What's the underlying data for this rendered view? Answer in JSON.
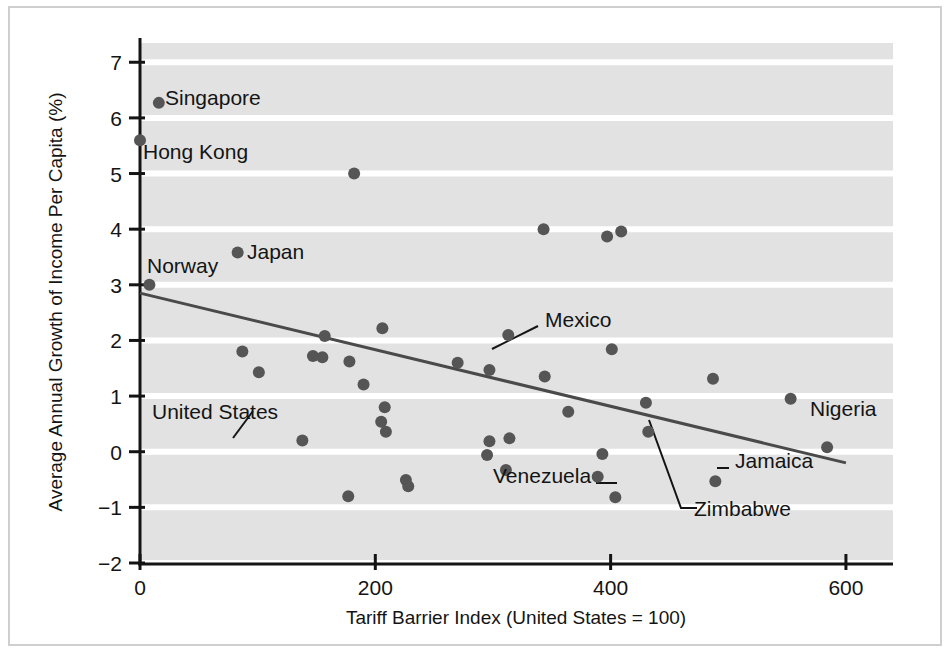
{
  "chart_data": {
    "type": "scatter",
    "title": "",
    "xlabel": "Tariff Barrier Index (United States = 100)",
    "ylabel": "Average Annual Growth of Income Per Capita (%)",
    "xlim": [
      0,
      640
    ],
    "ylim": [
      -2,
      7.4
    ],
    "xticks": [
      0,
      200,
      400,
      600
    ],
    "xtick_labels": [
      "0",
      "200",
      "400",
      "600"
    ],
    "yticks": [
      -2,
      -1,
      0,
      1,
      2,
      3,
      4,
      5,
      6,
      7
    ],
    "ytick_labels": [
      "−2",
      "−1",
      "0",
      "1",
      "2",
      "3",
      "4",
      "5",
      "6",
      "7"
    ],
    "grid": "horizontal-white-lines-on-gray",
    "legend": "none",
    "point_color": "#555555",
    "plot_background": "#e2e2e2",
    "gridline_color": "#ffffff",
    "trendline_color": "#4a4a4a",
    "trendline": {
      "x_start": 0,
      "y_start": 2.85,
      "x_end": 600,
      "y_end": -0.2
    },
    "points": [
      {
        "x": 16,
        "y": 6.27,
        "label": "Singapore",
        "label_side": "right",
        "leader": false
      },
      {
        "x": 0,
        "y": 5.6,
        "label": "Hong Kong",
        "label_side": "below-right",
        "leader": false
      },
      {
        "x": 182,
        "y": 5.0,
        "label": "",
        "leader": false
      },
      {
        "x": 343,
        "y": 4.0,
        "label": "",
        "leader": false
      },
      {
        "x": 397,
        "y": 3.87,
        "label": "",
        "leader": false
      },
      {
        "x": 409,
        "y": 3.96,
        "label": "",
        "leader": false
      },
      {
        "x": 83,
        "y": 3.58,
        "label": "Japan",
        "label_side": "right",
        "leader": false
      },
      {
        "x": 8,
        "y": 3.0,
        "label": "Norway",
        "label_side": "above-left",
        "leader": false
      },
      {
        "x": 206,
        "y": 2.22,
        "label": "",
        "leader": false
      },
      {
        "x": 157,
        "y": 2.08,
        "label": "",
        "leader": false
      },
      {
        "x": 313,
        "y": 2.1,
        "label": "",
        "leader": false
      },
      {
        "x": 87,
        "y": 1.8,
        "label": "",
        "leader": false
      },
      {
        "x": 147,
        "y": 1.72,
        "label": "",
        "leader": false
      },
      {
        "x": 155,
        "y": 1.7,
        "label": "",
        "leader": false
      },
      {
        "x": 178,
        "y": 1.62,
        "label": "",
        "leader": false
      },
      {
        "x": 270,
        "y": 1.6,
        "label": "",
        "leader": false
      },
      {
        "x": 297,
        "y": 1.47,
        "label": "Mexico",
        "label_side": "leader-right",
        "leader": true
      },
      {
        "x": 401,
        "y": 1.84,
        "label": "",
        "leader": false
      },
      {
        "x": 101,
        "y": 1.43,
        "label": "United States",
        "label_side": "leader-below-left",
        "leader": true
      },
      {
        "x": 344,
        "y": 1.35,
        "label": "",
        "leader": false
      },
      {
        "x": 487,
        "y": 1.31,
        "label": "",
        "leader": false
      },
      {
        "x": 190,
        "y": 1.21,
        "label": "",
        "leader": false
      },
      {
        "x": 553,
        "y": 0.95,
        "label": "",
        "leader": false
      },
      {
        "x": 430,
        "y": 0.88,
        "label": "",
        "leader": false
      },
      {
        "x": 208,
        "y": 0.8,
        "label": "",
        "leader": false
      },
      {
        "x": 364,
        "y": 0.72,
        "label": "",
        "leader": false
      },
      {
        "x": 205,
        "y": 0.54,
        "label": "",
        "leader": false
      },
      {
        "x": 209,
        "y": 0.36,
        "label": "",
        "leader": false
      },
      {
        "x": 432,
        "y": 0.36,
        "label": "Zimbabwe",
        "label_side": "leader-below",
        "leader": true
      },
      {
        "x": 314,
        "y": 0.24,
        "label": "",
        "leader": false
      },
      {
        "x": 297,
        "y": 0.19,
        "label": "",
        "leader": false
      },
      {
        "x": 138,
        "y": 0.2,
        "label": "",
        "leader": false
      },
      {
        "x": 584,
        "y": 0.08,
        "label": "Nigeria",
        "label_side": "above-right",
        "leader": false
      },
      {
        "x": 295,
        "y": -0.06,
        "label": "",
        "leader": false
      },
      {
        "x": 393,
        "y": -0.04,
        "label": "",
        "leader": false
      },
      {
        "x": 311,
        "y": -0.33,
        "label": "",
        "leader": false
      },
      {
        "x": 226,
        "y": -0.51,
        "label": "",
        "leader": false
      },
      {
        "x": 389,
        "y": -0.45,
        "label": "",
        "leader": false
      },
      {
        "x": 228,
        "y": -0.62,
        "label": "",
        "leader": false
      },
      {
        "x": 489,
        "y": -0.53,
        "label": "Jamaica",
        "label_side": "leader-right",
        "leader": true
      },
      {
        "x": 177,
        "y": -0.8,
        "label": "",
        "leader": false
      },
      {
        "x": 404,
        "y": -0.82,
        "label": "Venezuela",
        "label_side": "leader-left",
        "leader": true
      }
    ],
    "annotations": [
      {
        "text": "Singapore",
        "x_px": 165,
        "y_px": 105
      },
      {
        "text": "Hong Kong",
        "x_px": 143,
        "y_px": 159
      },
      {
        "text": "Japan",
        "x_px": 247,
        "y_px": 259
      },
      {
        "text": "Norway",
        "x_px": 147,
        "y_px": 273
      },
      {
        "text": "United States",
        "x_px": 152,
        "y_px": 419
      },
      {
        "text": "Mexico",
        "x_px": 545,
        "y_px": 327
      },
      {
        "text": "Nigeria",
        "x_px": 810,
        "y_px": 416
      },
      {
        "text": "Jamaica",
        "x_px": 735,
        "y_px": 468
      },
      {
        "text": "Zimbabwe",
        "x_px": 694,
        "y_px": 516
      },
      {
        "text": "Venezuela",
        "x_px": 493,
        "y_px": 483
      }
    ]
  },
  "axes": {
    "y_axis_title": "Average Annual Growth of Income Per Capita (%)",
    "x_axis_title": "Tariff Barrier Index (United States = 100)"
  }
}
